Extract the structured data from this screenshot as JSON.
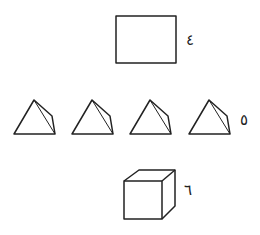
{
  "figures": [
    {
      "id": "rectangle",
      "label": "٤",
      "shape": "rectangle"
    },
    {
      "id": "pyramids",
      "label": "٥",
      "shape": "pyramid",
      "count": 4
    },
    {
      "id": "cube",
      "label": "٦",
      "shape": "cube"
    }
  ],
  "colors": {
    "stroke": "#222222",
    "background": "#ffffff"
  }
}
